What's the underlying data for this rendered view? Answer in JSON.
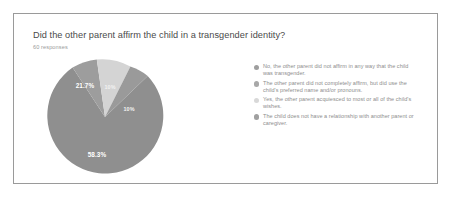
{
  "card": {
    "question": "Did the other parent affirm the child in a transgender identity?",
    "responses_label": "60 responses"
  },
  "legend": {
    "items": [
      {
        "label": "No, the other parent did not affirm in any way that the child was transgender.",
        "color": "#9e9e9e",
        "dot_name": "legend-dot-no-affirm"
      },
      {
        "label": "The other parent did not completely affirm, but did use the child's preferred name and/or pronouns.",
        "color": "#a8a8a8",
        "dot_name": "legend-dot-partial-affirm"
      },
      {
        "label": "Yes, the other parent acquiesced to most or all of the child's wishes.",
        "color": "#d8d8d8",
        "dot_name": "legend-dot-yes-acquiesced"
      },
      {
        "label": "The child does not have a relationship with another parent or caregiver.",
        "color": "#a0a0a0",
        "dot_name": "legend-dot-no-relationship"
      }
    ]
  },
  "chart_data": {
    "type": "pie",
    "title": "Did the other parent affirm the child in a transgender identity?",
    "subtitle": "60 responses",
    "total_responses": 60,
    "legend_position": "right",
    "grid": false,
    "categories": [
      "No, the other parent did not affirm in any way that the child was transgender.",
      "The other parent did not completely affirm, but did use the child's preferred name and/or pronouns.",
      "Yes, the other parent acquiesced to most or all of the child's wishes.",
      "The child does not have a relationship with another parent or caregiver."
    ],
    "values": [
      58.3,
      21.7,
      10,
      10
    ],
    "data_labels": [
      "58.3%",
      "21.7%",
      "10%",
      "10%"
    ],
    "colors": [
      "#9e9e9e",
      "#a8a8a8",
      "#d8d8d8",
      "#a0a0a0"
    ],
    "slices": [
      {
        "label": "58.3%",
        "value": 58.3,
        "color": "#8f8f8f",
        "name": "pie-slice-no-affirm",
        "path": "M 59 59 L 101.7 17.9 A 58 58 0 1 1 26.6 9.6 Z",
        "label_x": 51,
        "label_y": 99
      },
      {
        "label": "21.7%",
        "value": 21.7,
        "color": "#9d9d9d",
        "name": "pie-slice-partial-affirm",
        "path": "M 59 59 L 26.6 9.6 A 58 58 0 0 1 50.8 1.6 Z",
        "label_x": 39,
        "label_y": 30
      },
      {
        "label": "10%",
        "value": 10,
        "color": "#d4d4d4",
        "name": "pie-slice-yes-acquiesced",
        "path": "M 59 59 L 50.8 1.6 A 58 58 0 0 1 84.4 8.6 Z",
        "label_x": 64,
        "label_y": 31
      },
      {
        "label": "10%",
        "value": 10,
        "color": "#9a9a9a",
        "name": "pie-slice-no-relationship",
        "path": "M 59 59 L 84.4 8.6 A 58 58 0 0 1 101.7 17.9 Z",
        "label_x": 83,
        "label_y": 53
      }
    ]
  }
}
